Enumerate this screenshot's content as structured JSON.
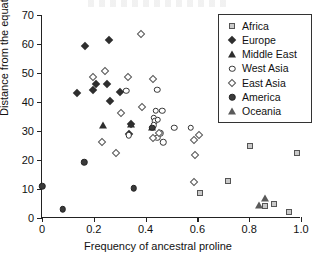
{
  "chart_data": {
    "type": "scatter",
    "title": "",
    "xlabel": "Frequency of ancestral proline",
    "ylabel": "Distance from the equator",
    "xlim": [
      0,
      1.0
    ],
    "ylim": [
      0,
      70
    ],
    "xticks": [
      "0",
      "0.2",
      "0.4",
      "0.6",
      "0.8",
      "1.0"
    ],
    "xtick_values": [
      0,
      0.2,
      0.4,
      0.6,
      0.8,
      1.0
    ],
    "yticks": [
      "0",
      "10",
      "20",
      "30",
      "40",
      "50",
      "60",
      "70"
    ],
    "ytick_values": [
      0,
      10,
      20,
      30,
      40,
      50,
      60,
      70
    ],
    "grid": false,
    "legend_position": "top-right",
    "series": [
      {
        "name": "Africa",
        "marker": "square-open-gray",
        "points": [
          [
            0.805,
            25.0
          ],
          [
            0.985,
            22.4
          ],
          [
            0.72,
            12.6
          ],
          [
            0.61,
            8.7
          ],
          [
            0.862,
            4.0
          ],
          [
            0.895,
            5.0
          ],
          [
            0.955,
            2.1
          ]
        ]
      },
      {
        "name": "Europe",
        "marker": "diamond-filled",
        "points": [
          [
            0.165,
            59.3
          ],
          [
            0.258,
            61.3
          ],
          [
            0.135,
            43.1
          ],
          [
            0.196,
            44.0
          ],
          [
            0.207,
            46.1
          ],
          [
            0.252,
            46.2
          ],
          [
            0.262,
            40.2
          ],
          [
            0.3,
            43.4
          ],
          [
            0.345,
            32.3
          ],
          [
            0.335,
            29.0
          ]
        ]
      },
      {
        "name": "Middle East",
        "marker": "triangle-filled",
        "points": [
          [
            0.235,
            32.0
          ],
          [
            0.345,
            32.4
          ],
          [
            0.425,
            31.5
          ]
        ]
      },
      {
        "name": "West Asia",
        "marker": "circle-open",
        "points": [
          [
            0.325,
            43.8
          ],
          [
            0.445,
            44.3
          ],
          [
            0.44,
            37.0
          ],
          [
            0.465,
            37.0
          ],
          [
            0.432,
            34.6
          ],
          [
            0.435,
            33.3
          ],
          [
            0.447,
            33.8
          ],
          [
            0.432,
            32.0
          ],
          [
            0.456,
            29.3
          ],
          [
            0.445,
            27.6
          ],
          [
            0.468,
            26.1
          ],
          [
            0.335,
            28.6
          ],
          [
            0.51,
            31.2
          ],
          [
            0.575,
            31.1
          ]
        ]
      },
      {
        "name": "East Asia",
        "marker": "diamond-open",
        "points": [
          [
            0.383,
            63.4
          ],
          [
            0.245,
            50.7
          ],
          [
            0.196,
            48.7
          ],
          [
            0.333,
            48.7
          ],
          [
            0.43,
            48.0
          ],
          [
            0.305,
            36.1
          ],
          [
            0.385,
            38.4
          ],
          [
            0.232,
            26.2
          ],
          [
            0.428,
            27.5
          ],
          [
            0.452,
            29.3
          ],
          [
            0.285,
            22.3
          ],
          [
            0.585,
            27.0
          ],
          [
            0.605,
            28.6
          ],
          [
            0.59,
            21.8
          ],
          [
            0.585,
            12.3
          ]
        ]
      },
      {
        "name": "America",
        "marker": "circle-filled",
        "points": [
          [
            0.0,
            10.9
          ],
          [
            0.08,
            3.0
          ],
          [
            0.163,
            19.2
          ],
          [
            0.355,
            10.3
          ],
          [
            0.425,
            31.2
          ]
        ]
      },
      {
        "name": "Oceania",
        "marker": "triangle-gray",
        "points": [
          [
            0.838,
            4.6
          ],
          [
            0.862,
            6.8
          ]
        ]
      }
    ]
  },
  "legend": {
    "items": [
      {
        "label": "Africa",
        "marker": "square-open-gray"
      },
      {
        "label": "Europe",
        "marker": "diamond-filled"
      },
      {
        "label": "Middle East",
        "marker": "triangle-filled"
      },
      {
        "label": "West Asia",
        "marker": "circle-open"
      },
      {
        "label": "East Asia",
        "marker": "diamond-open"
      },
      {
        "label": "America",
        "marker": "circle-filled"
      },
      {
        "label": "Oceania",
        "marker": "triangle-gray"
      }
    ]
  },
  "colors": {
    "axis": "#222222",
    "marker_dark": "#2e2e2e",
    "marker_gray": "#c9c9c9",
    "background": "#ffffff"
  }
}
